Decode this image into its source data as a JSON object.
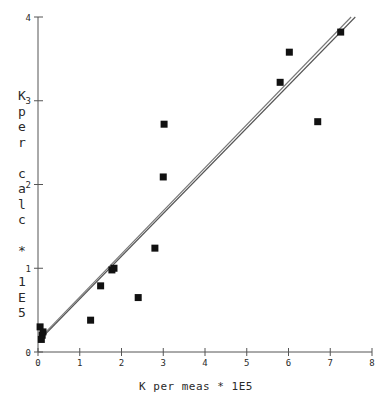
{
  "chart_data": {
    "type": "scatter",
    "title": "",
    "xlabel": "K per meas * 1E5",
    "ylabel": "K per calc * 1E5",
    "ylabel_chars": [
      "K",
      "p",
      "e",
      "r",
      "",
      "c",
      "a",
      "l",
      "c",
      "",
      "*",
      "",
      "1",
      "E",
      "5"
    ],
    "xlim": [
      0,
      8
    ],
    "ylim": [
      0,
      4
    ],
    "xticks": [
      0,
      1,
      2,
      3,
      4,
      5,
      6,
      7,
      8
    ],
    "yticks": [
      0,
      1,
      2,
      3,
      4
    ],
    "xtick_labels": [
      "0",
      "1",
      "2",
      "3",
      "4",
      "5",
      "6",
      "7",
      "8"
    ],
    "ytick_labels": [
      "0",
      "1",
      "2",
      "3",
      "4"
    ],
    "grid": false,
    "legend": null,
    "marker": "filled-square",
    "marker_color": "#111111",
    "marker_size_px": 7,
    "points": [
      {
        "x": 0.05,
        "y": 0.3
      },
      {
        "x": 0.1,
        "y": 0.2
      },
      {
        "x": 0.12,
        "y": 0.24
      },
      {
        "x": 0.08,
        "y": 0.15
      },
      {
        "x": 1.26,
        "y": 0.38
      },
      {
        "x": 1.5,
        "y": 0.79
      },
      {
        "x": 1.77,
        "y": 0.98
      },
      {
        "x": 1.82,
        "y": 1.0
      },
      {
        "x": 2.4,
        "y": 0.65
      },
      {
        "x": 2.8,
        "y": 1.24
      },
      {
        "x": 3.0,
        "y": 2.09
      },
      {
        "x": 3.02,
        "y": 2.72
      },
      {
        "x": 5.8,
        "y": 3.22
      },
      {
        "x": 6.02,
        "y": 3.58
      },
      {
        "x": 6.7,
        "y": 2.75
      },
      {
        "x": 7.25,
        "y": 3.82
      }
    ],
    "lines": [
      {
        "name": "identity-line",
        "x0": 0.15,
        "y0": 0.2,
        "x1": 7.6,
        "y1": 4.0,
        "color": "#555555"
      },
      {
        "name": "fit-line",
        "x0": 0.15,
        "y0": 0.22,
        "x1": 7.5,
        "y1": 4.0,
        "color": "#777777"
      }
    ],
    "axis_color": "#555555",
    "background": "#ffffff"
  }
}
